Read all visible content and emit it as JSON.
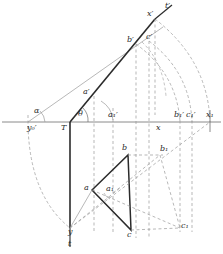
{
  "figure": {
    "type": "diagram",
    "kind": "descriptive-geometry-orthographic-projection",
    "title": "",
    "background_color": "#ffffff",
    "stroke_color": "#2b2b2b",
    "thin_stroke_color": "#8a8a8a",
    "dash_color": "#9a9a9a",
    "width": 223,
    "height": 254
  },
  "labels": {
    "alpha": "α",
    "theta": "θ",
    "t_prime": "t′",
    "t": "t",
    "x_prime": "x′",
    "x": "x",
    "x1": "x₁",
    "T": "T",
    "y": "y",
    "y0_prime": "y₀′",
    "a_prime": "a′",
    "b_prime": "b′",
    "c_prime": "c′",
    "a1_prime": "a₁′",
    "b1_prime": "b₁′",
    "c1_prime": "c₁′",
    "a": "a",
    "b": "b",
    "c": "c",
    "a1": "a₁",
    "b1": "b₁",
    "c1": "c₁"
  },
  "points": {
    "T": {
      "x": 70,
      "y": 122
    },
    "y": {
      "x": 70,
      "y": 228
    },
    "t_end": {
      "x": 70,
      "y": 247
    },
    "y0_prime": {
      "x": 28,
      "y": 122
    },
    "a1_prime_axis": {
      "x": 113,
      "y": 122
    },
    "x_axis": {
      "x": 155,
      "y": 122
    },
    "b1_prime_axis": {
      "x": 180,
      "y": 122
    },
    "c1_prime_axis": {
      "x": 192,
      "y": 122
    },
    "x1_axis": {
      "x": 210,
      "y": 122
    },
    "a_prime": {
      "x": 94,
      "y": 96
    },
    "b_prime": {
      "x": 136,
      "y": 44
    },
    "c_prime": {
      "x": 149,
      "y": 41
    },
    "x_prime": {
      "x": 155,
      "y": 19
    },
    "t_prime_end": {
      "x": 172,
      "y": 5
    },
    "a": {
      "x": 92,
      "y": 190
    },
    "b": {
      "x": 128,
      "y": 155
    },
    "c": {
      "x": 131,
      "y": 230
    },
    "a1": {
      "x": 113,
      "y": 193
    },
    "b1": {
      "x": 160,
      "y": 155
    },
    "c1": {
      "x": 180,
      "y": 228
    }
  },
  "elements": {
    "ground_line": "horizontal reference axis",
    "trace_line_t": "vertical trace line T-y-t",
    "trace_line_t_prime": "inclined trace line T-a'-b'-x'-t'",
    "triangle_projection": "triangle a-b-c (bottom view)",
    "triangle_rotated": "triangle a1-b1-c1 (rotated auxiliary)",
    "rotation_arcs": "arcs from x', c', b' down to x1, c1', b1'",
    "rotation_arc_left": "arc from y0' down to y",
    "angle_arc_alpha": "angle alpha at y0'",
    "angle_arc_theta": "angle theta at T",
    "angle_arc_a": "angle arc at a'"
  }
}
